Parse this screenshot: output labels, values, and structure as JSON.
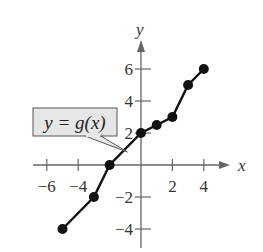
{
  "chart_data": {
    "type": "line",
    "title": "",
    "xlabel": "x",
    "ylabel": "y",
    "xlim": [
      -6.5,
      6.5
    ],
    "ylim": [
      -5,
      7.5
    ],
    "grid": false,
    "x_ticks": [
      -6,
      -4,
      2,
      4
    ],
    "x_tick_labels": [
      "−6",
      "−4",
      "2",
      "4"
    ],
    "y_ticks": [
      6,
      4,
      2,
      -2,
      -4
    ],
    "y_tick_labels": [
      "6",
      "4",
      "2",
      "−2",
      "−4"
    ],
    "series": [
      {
        "name": "y = g(x)",
        "markers": true,
        "points": [
          [
            -5,
            -4
          ],
          [
            -3,
            -2
          ],
          [
            -2,
            0
          ],
          [
            0,
            2
          ],
          [
            1,
            2.5
          ],
          [
            2,
            3
          ],
          [
            3,
            5
          ],
          [
            4,
            6
          ]
        ]
      }
    ],
    "annotations": [
      {
        "text": "y = g(x)",
        "type": "callout",
        "points_to": [
          -1,
          1
        ]
      }
    ],
    "colors": {
      "line": "#111111",
      "axis": "#666666",
      "callout_bg": "#e6e6e6"
    }
  }
}
